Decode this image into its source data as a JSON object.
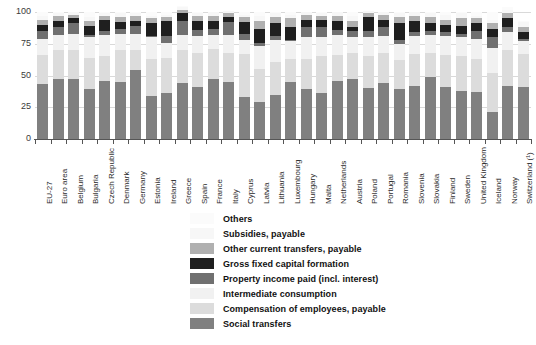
{
  "chart_data": {
    "type": "bar",
    "stacked": true,
    "title": "",
    "subtitle": "",
    "xlabel": "",
    "ylabel": "",
    "ylim": [
      0,
      100
    ],
    "yticks": [
      0,
      25,
      50,
      75,
      100
    ],
    "ytick_labels": [
      "0",
      "25",
      "50",
      "75",
      "100"
    ],
    "grid": true,
    "grid_axis": "y",
    "legend_position": "bottom-center",
    "categories": [
      "EU-27",
      "Euro area",
      "Belgium",
      "Bulgaria",
      "Czech Republic",
      "Denmark",
      "Germany",
      "Estonia",
      "Ireland",
      "Greece",
      "Spain",
      "France",
      "Italy",
      "Cyprus",
      "Latvia",
      "Lithuania",
      "Luxembourg",
      "Hungary",
      "Malta",
      "Netherlands",
      "Austria",
      "Poland",
      "Portugal",
      "Romania",
      "Slovenia",
      "Slovakia",
      "Finland",
      "Sweden",
      "United Kingdom",
      "Iceland",
      "Norway",
      "Switzerland (¹)"
    ],
    "series": [
      {
        "name": "Social transfers",
        "color": "#808080",
        "values": [
          43,
          47,
          47,
          39,
          46,
          45,
          54,
          34,
          36,
          44,
          41,
          47,
          45,
          33,
          29,
          35,
          45,
          39,
          36,
          46,
          47,
          40,
          44,
          39,
          42,
          49,
          41,
          38,
          37,
          21,
          42,
          41
        ]
      },
      {
        "name": "Compensation of employees, payable",
        "color": "#dcdcdc",
        "values": [
          23,
          23,
          23,
          25,
          19,
          25,
          16,
          29,
          28,
          26,
          27,
          24,
          23,
          34,
          26,
          26,
          18,
          24,
          29,
          20,
          21,
          25,
          24,
          23,
          25,
          19,
          25,
          27,
          26,
          31,
          28,
          26
        ]
      },
      {
        "name": "Intermediate consumption",
        "color": "#f1f1f1",
        "values": [
          13,
          12,
          13,
          16,
          17,
          13,
          13,
          17,
          12,
          12,
          13,
          11,
          14,
          11,
          18,
          17,
          14,
          17,
          15,
          16,
          12,
          15,
          13,
          13,
          14,
          14,
          15,
          15,
          16,
          20,
          14,
          10
        ]
      },
      {
        "name": "Property income paid (incl. interest)",
        "color": "#707070",
        "values": [
          6,
          6,
          8,
          2,
          3,
          4,
          6,
          1,
          5,
          11,
          5,
          5,
          10,
          5,
          3,
          3,
          1,
          8,
          8,
          4,
          5,
          5,
          7,
          3,
          3,
          3,
          3,
          3,
          6,
          8,
          4,
          2
        ]
      },
      {
        "name": "Gross fixed capital formation",
        "color": "#1f1f1f",
        "values": [
          5,
          5,
          4,
          7,
          9,
          5,
          4,
          10,
          12,
          6,
          7,
          6,
          4,
          9,
          11,
          10,
          10,
          6,
          6,
          7,
          3,
          11,
          6,
          13,
          9,
          6,
          6,
          6,
          6,
          7,
          7,
          5
        ]
      },
      {
        "name": "Other current transfers, payable",
        "color": "#b0b0b0",
        "values": [
          4,
          4,
          3,
          4,
          3,
          4,
          4,
          4,
          3,
          3,
          4,
          4,
          3,
          4,
          6,
          5,
          7,
          4,
          3,
          4,
          5,
          3,
          4,
          5,
          4,
          5,
          4,
          6,
          4,
          4,
          4,
          4
        ]
      },
      {
        "name": "Subsidies, payable",
        "color": "#f7f7f7",
        "values": [
          3,
          2,
          2,
          3,
          2,
          3,
          2,
          2,
          2,
          2,
          2,
          3,
          2,
          2,
          4,
          3,
          3,
          2,
          2,
          3,
          4,
          2,
          2,
          3,
          3,
          3,
          4,
          4,
          2,
          3,
          3,
          4
        ]
      },
      {
        "name": "Others",
        "color": "#fbfbfb",
        "values": [
          3,
          1,
          0,
          4,
          1,
          1,
          1,
          3,
          2,
          1,
          1,
          0,
          0,
          2,
          3,
          1,
          2,
          0,
          1,
          0,
          3,
          0,
          0,
          1,
          0,
          1,
          2,
          1,
          3,
          6,
          2,
          1
        ]
      }
    ],
    "legend_order_top_to_bottom": [
      "Others",
      "Subsidies, payable",
      "Other current transfers, payable",
      "Gross fixed capital formation",
      "Property income paid (incl. interest)",
      "Intermediate consumption",
      "Compensation of employees, payable",
      "Social transfers"
    ]
  },
  "legend": {
    "items": [
      {
        "label": "Others",
        "color": "#fbfbfb"
      },
      {
        "label": "Subsidies, payable",
        "color": "#f7f7f7"
      },
      {
        "label": "Other current transfers, payable",
        "color": "#b0b0b0"
      },
      {
        "label": "Gross fixed capital formation",
        "color": "#1f1f1f"
      },
      {
        "label": "Property income paid (incl. interest)",
        "color": "#707070"
      },
      {
        "label": "Intermediate consumption",
        "color": "#f1f1f1"
      },
      {
        "label": "Compensation of employees, payable",
        "color": "#dcdcdc"
      },
      {
        "label": "Social transfers",
        "color": "#808080"
      }
    ]
  },
  "colors": {
    "axis": "#555555",
    "grid": "#d9d9d9",
    "tick_text": "#3a3a3a",
    "label_text": "#2b2b2b",
    "legend_text": "#111111",
    "background": "#ffffff"
  }
}
